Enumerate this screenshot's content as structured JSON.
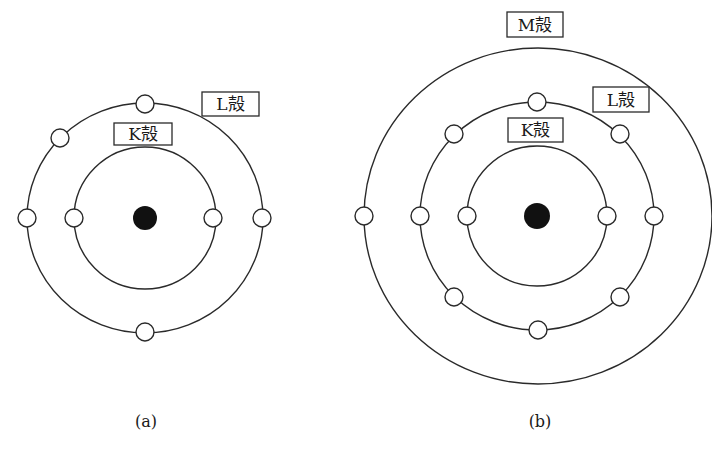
{
  "figure": {
    "panels": [
      {
        "id": "a",
        "caption": "(a)",
        "nucleus": {
          "cx": 145,
          "cy": 218,
          "r": 12
        },
        "shells": [
          {
            "name": "K",
            "label": "K殻",
            "rx": 71,
            "ry": 71,
            "electron_count": 2,
            "electrons": [
              [
                74,
                218
              ],
              [
                216,
                218
              ]
            ],
            "label_box": {
              "x": 114,
              "y": 123,
              "w": 58,
              "h": 22
            }
          },
          {
            "name": "L",
            "label": "L殻",
            "rx": 118,
            "ry": 115,
            "electron_count": 6,
            "electrons": [
              [
                145,
                103
              ],
              [
                62,
                138
              ],
              [
                27,
                218
              ],
              [
                263,
                218
              ],
              [
                145,
                333
              ]
            ],
            "label_box": {
              "x": 202,
              "y": 92,
              "w": 57,
              "h": 24
            }
          }
        ]
      },
      {
        "id": "b",
        "caption": "(b)",
        "nucleus": {
          "cx": 537,
          "cy": 216,
          "r": 13
        },
        "shells": [
          {
            "name": "K",
            "label": "K殻",
            "rx": 70,
            "ry": 70,
            "electron_count": 2,
            "electrons": [
              [
                467,
                216
              ],
              [
                607,
                216
              ]
            ],
            "label_box": {
              "x": 508,
              "y": 118,
              "w": 55,
              "h": 24
            }
          },
          {
            "name": "L",
            "label": "L殻",
            "rx": 117,
            "ry": 114,
            "electron_count": 8,
            "electrons": [
              [
                537,
                102
              ],
              [
                454,
                134
              ],
              [
                620,
                134
              ],
              [
                420,
                216
              ],
              [
                654,
                216
              ],
              [
                454,
                297
              ],
              [
                620,
                297
              ],
              [
                538,
                330
              ]
            ],
            "label_box": {
              "x": 593,
              "y": 87,
              "w": 56,
              "h": 25
            }
          },
          {
            "name": "M",
            "label": "M殻",
            "rx": 174,
            "ry": 168,
            "electron_count": 1,
            "electrons": [
              [
                364,
                216
              ]
            ],
            "label_box": {
              "x": 507,
              "y": 12,
              "w": 56,
              "h": 25
            }
          }
        ]
      }
    ]
  },
  "labels": {
    "a_K": "K殻",
    "a_L": "L殻",
    "b_K": "K殻",
    "b_L": "L殻",
    "b_M": "M殻",
    "caption_a": "(a)",
    "caption_b": "(b)"
  },
  "colors": {
    "stroke": "#2a2a2a",
    "nucleus": "#111111",
    "background": "#ffffff"
  }
}
